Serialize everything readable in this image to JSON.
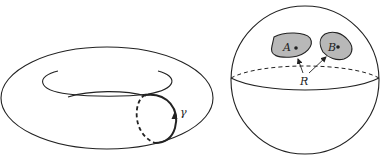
{
  "figure": {
    "left": {
      "name": "torus",
      "curve_label": "γ"
    },
    "right": {
      "name": "sphere",
      "region_a_label": "A",
      "region_b_label": "B",
      "connector_label": "R"
    }
  },
  "colors": {
    "stroke": "#222222",
    "region_fill": "#b8b8b8",
    "background": "#ffffff"
  }
}
